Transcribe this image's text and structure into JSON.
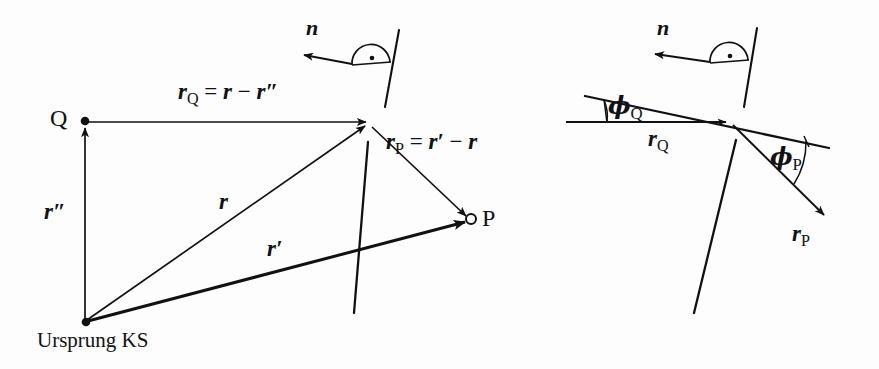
{
  "figure": {
    "type": "vector-geometry-diagram",
    "language": "de",
    "background_color": "#fdfdfd",
    "ink_color": "#111111",
    "panels": [
      "left-vector-construction",
      "right-angle-detail"
    ]
  },
  "left_panel": {
    "origin_label": "Ursprung KS",
    "point_q_label": "Q",
    "point_p_label": "P",
    "normal_label": "n",
    "formula_rq": {
      "lhs_vector": "r",
      "lhs_subscript": "Q",
      "equals": "=",
      "term1": "r",
      "minus": "−",
      "term2": "r",
      "term2_prime": "″"
    },
    "formula_rp": {
      "lhs_vector": "r",
      "lhs_subscript": "P",
      "equals": "=",
      "term1": "r",
      "term1_prime": "′",
      "minus": "−",
      "term2": "r"
    },
    "vector_r": "r",
    "vector_r_prime": "r",
    "vector_r_prime_mark": "′",
    "vector_r_dprime": "r",
    "vector_r_dprime_mark": "″",
    "right_angle_marker": "right-angle-dot"
  },
  "right_panel": {
    "normal_label": "n",
    "angle_q_symbol": "ϕ",
    "angle_q_subscript": "Q",
    "angle_p_symbol": "ϕ",
    "angle_p_subscript": "P",
    "vector_rq": "r",
    "vector_rq_subscript": "Q",
    "vector_rp": "r",
    "vector_rp_subscript": "P",
    "right_angle_marker": "right-angle-dot"
  },
  "colors": {
    "ink": "#111111",
    "paper": "#fdfdfd"
  }
}
